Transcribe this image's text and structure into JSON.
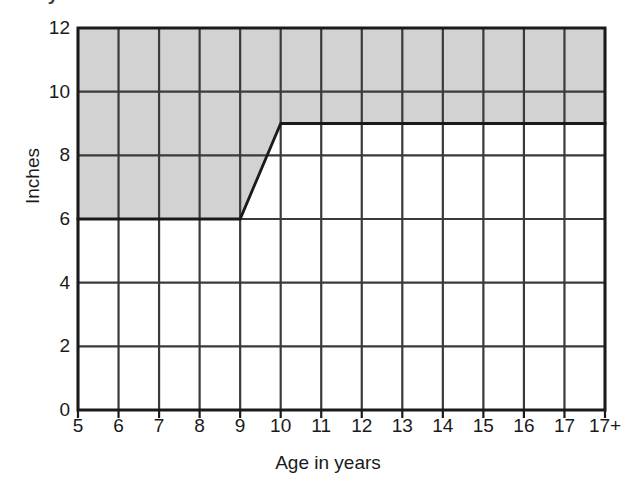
{
  "title": "Boy's dilation",
  "axes": {
    "y_label": "Inches",
    "x_label": "Age in years"
  },
  "chart_data": {
    "type": "area",
    "title": "Boy's dilation",
    "xlabel": "Age in years",
    "ylabel": "Inches",
    "x_tick_labels": [
      "5",
      "6",
      "7",
      "8",
      "9",
      "10",
      "11",
      "12",
      "13",
      "14",
      "15",
      "16",
      "17",
      "17+"
    ],
    "x_tick_values": [
      5,
      6,
      7,
      8,
      9,
      10,
      11,
      12,
      13,
      14,
      15,
      16,
      17,
      18
    ],
    "y_tick_labels": [
      "0",
      "2",
      "4",
      "6",
      "8",
      "10",
      "12"
    ],
    "y_tick_values": [
      0,
      2,
      4,
      6,
      8,
      10,
      12
    ],
    "xlim": [
      5,
      18
    ],
    "ylim": [
      0,
      12
    ],
    "grid": true,
    "grid_x_every": 1,
    "grid_y_every": 2,
    "legend": "none",
    "series": [
      {
        "name": "Shaded region lower boundary",
        "x": [
          5,
          9,
          10,
          18
        ],
        "values": [
          6,
          6,
          9,
          9
        ],
        "fill_to": 12,
        "fill_color": "#d2d2d2",
        "line_color": "#1a1a1a"
      }
    ],
    "annotations": [
      {
        "text": "Shaded band spans from the boundary line up to 12 inches"
      },
      {
        "text": "Boundary steps from 6 inches at age 9 up to 9 inches at age 10 along a straight diagonal"
      }
    ]
  },
  "colors": {
    "shade": "#d2d2d2",
    "grid": "#3a3a3a",
    "axis": "#1a1a1a",
    "boundary": "#111111",
    "background": "#ffffff"
  }
}
